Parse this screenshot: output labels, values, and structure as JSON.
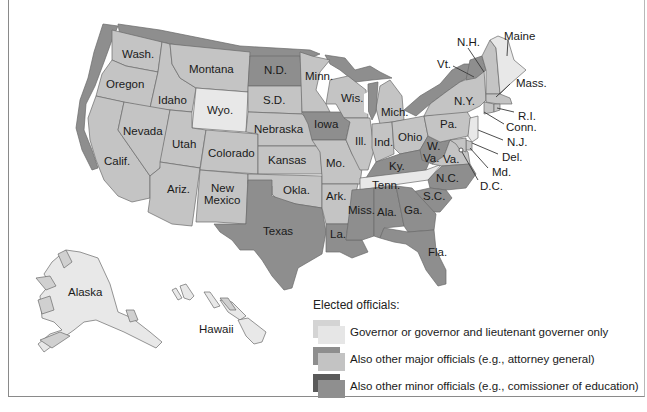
{
  "legend": {
    "title": "Elected officials:",
    "items": [
      {
        "label": "Governor or governor and lieutenant governer only",
        "face": "#e6e6e6",
        "side": "#d2d2d2"
      },
      {
        "label": "Also other major officials (e.g., attorney general)",
        "face": "#c3c3c3",
        "side": "#8e8e8e"
      },
      {
        "label": "Also other minor officials (e.g., comissioner of education)",
        "face": "#8f8f8f",
        "side": "#5a5a5a"
      }
    ]
  },
  "colors": {
    "light": "#e8e8e8",
    "medium": "#c4c4c4",
    "dark": "#8e8e8e",
    "darkest": "#6e6e6e",
    "shadow": "#9a9a9a",
    "border": "#6a6a6a"
  },
  "states": {
    "wash": "Wash.",
    "oregon": "Oregon",
    "calif": "Calif.",
    "idaho": "Idaho",
    "nevada": "Nevada",
    "montana": "Montana",
    "wyo": "Wyo.",
    "utah": "Utah",
    "ariz": "Ariz.",
    "colorado": "Colorado",
    "new": "New",
    "mexico": "Mexico",
    "nd": "N.D.",
    "sd": "S.D.",
    "nebraska": "Nebraska",
    "kansas": "Kansas",
    "okla": "Okla.",
    "texas": "Texas",
    "minn": "Minn.",
    "iowa": "Iowa",
    "mo": "Mo.",
    "ark": "Ark.",
    "la": "La.",
    "wis": "Wis.",
    "ill": "Ill.",
    "mich": "Mich.",
    "ind": "Ind.",
    "ohio": "Ohio",
    "ky": "Ky.",
    "tenn": "Tenn.",
    "miss": "Miss.",
    "ala": "Ala.",
    "ga": "Ga.",
    "fla": "Fla.",
    "sc": "S.C.",
    "nc": "N.C.",
    "va": "Va.",
    "wva_w": "W.",
    "wva_va": "Va.",
    "pa": "Pa.",
    "ny": "N.Y.",
    "alaska": "Alaska",
    "hawaii": "Hawaii"
  },
  "callouts": {
    "maine": "Maine",
    "nh": "N.H.",
    "vt": "Vt.",
    "mass": "Mass.",
    "ri": "R.I.",
    "conn": "Conn.",
    "nj": "N.J.",
    "del": "Del.",
    "md": "Md.",
    "dc": "D.C."
  },
  "state_categories": {
    "governor_only": [
      "Wyo.",
      "Tenn.",
      "N.J.",
      "Maine",
      "Alaska",
      "Hawaii"
    ],
    "major_officials": [
      "Wash.",
      "Oregon",
      "Calif.",
      "Idaho",
      "Nevada",
      "Montana",
      "Utah",
      "Ariz.",
      "Colorado",
      "New Mexico",
      "S.D.",
      "Nebraska",
      "Kansas",
      "Okla.",
      "Minn.",
      "Mo.",
      "Ark.",
      "Wis.",
      "Ill.",
      "Mich.",
      "Ind.",
      "Ohio",
      "Va.",
      "Pa.",
      "N.Y.",
      "Mass.",
      "R.I.",
      "Conn.",
      "Del.",
      "Md.",
      "N.H.",
      "D.C."
    ],
    "minor_officials": [
      "N.D.",
      "Iowa",
      "Texas",
      "La.",
      "Miss.",
      "Ala.",
      "Ga.",
      "Fla.",
      "S.C.",
      "N.C.",
      "Ky.",
      "W. Va.",
      "Vt."
    ]
  }
}
